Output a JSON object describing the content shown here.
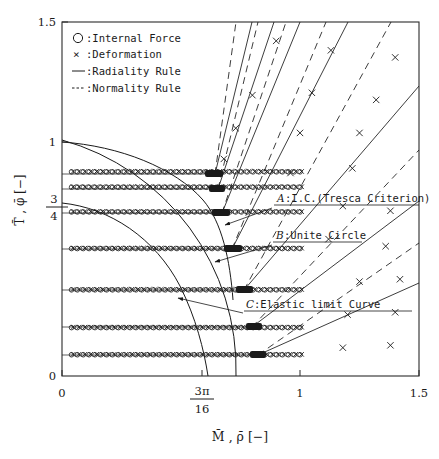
{
  "figure": {
    "title": "",
    "frame": {
      "x0": 62,
      "y0": 22,
      "x1": 419,
      "y1": 376
    }
  },
  "legend": {
    "entries": [
      {
        "marker": "circle-marker",
        "symbol": "O",
        "label": ":Internal Force"
      },
      {
        "marker": "cross-marker",
        "symbol": "×",
        "label": ":Deformation"
      },
      {
        "marker": "solid-line",
        "symbol": "—",
        "label": ":Radiality Rule"
      },
      {
        "marker": "dashed-line",
        "symbol": "---",
        "label": ":Normality Rule"
      }
    ]
  },
  "annotations": [
    {
      "id": "A",
      "key": "A",
      "text": ":I.C.(Tresca Criterion)",
      "x": 277,
      "y": 203
    },
    {
      "id": "B",
      "key": "B",
      "text": ":Unite Circle",
      "x": 276,
      "y": 240
    },
    {
      "id": "C",
      "key": "C",
      "text": ":Elastic limit Curve",
      "x": 246,
      "y": 310
    }
  ],
  "axes": {
    "x": {
      "label_parts": [
        "M",
        ", ",
        "ρ",
        "  [−]"
      ],
      "label": "M̄ , ρ̄  [−]",
      "min": 0,
      "max": 1.5,
      "ticks": [
        {
          "value": 0,
          "text": "0",
          "kind": "plain"
        },
        {
          "value": 0.589,
          "text": "3π/16",
          "kind": "fraction",
          "num": "3π",
          "den": "16"
        },
        {
          "value": 1.0,
          "text": "1",
          "kind": "plain"
        },
        {
          "value": 1.5,
          "text": "1.5",
          "kind": "plain"
        }
      ]
    },
    "y": {
      "label": "T̄ , φ̄  [−]",
      "label_parts": [
        "T",
        ", ",
        "φ",
        "  [−]"
      ],
      "min": 0,
      "max": 1.5,
      "ticks": [
        {
          "value": 0,
          "text": "0",
          "kind": "plain"
        },
        {
          "value": 0.75,
          "text": "3/4",
          "kind": "fraction",
          "num": "3",
          "den": "4"
        },
        {
          "value": 1.0,
          "text": "1",
          "kind": "plain"
        },
        {
          "value": 1.5,
          "text": "1.5",
          "kind": "plain"
        }
      ]
    }
  },
  "chart_data": {
    "type": "scatter",
    "title": "",
    "xlabel": "M̄ , ρ̄  [−]",
    "ylabel": "T̄ , φ̄  [−]",
    "xlim": [
      0,
      1.5
    ],
    "ylim": [
      0,
      1.5
    ],
    "grid": false,
    "legend_position": "top-left",
    "legend": [
      ":Internal Force",
      ":Deformation",
      ":Radiality Rule",
      ":Normality Rule"
    ],
    "series": [
      {
        "name": "Internal Force / Deformation paths (plateau level T̄)",
        "marker": "circle+cross",
        "plateau_levels": [
          0.865,
          0.8,
          0.695,
          0.54,
          0.365,
          0.205,
          0.09
        ],
        "plateau_x_start": 0.04,
        "plateau_x_end": 1.0,
        "description": "Horizontal loading paths at constant T̄ up to the yield surface at M̄ near 1, then turning outward"
      },
      {
        "name": "Radiality Rule",
        "style": "solid",
        "type": "line",
        "fan_origin": [
          1.0,
          0.0
        ],
        "description": "Solid straight rays emanating from the yield-surface contact points to the upper-right"
      },
      {
        "name": "Normality Rule",
        "style": "dashed",
        "type": "line",
        "fan_origin": [
          1.0,
          0.0
        ],
        "description": "Dashed straight rays, steeper than the solid radiality rays"
      },
      {
        "name": "A: I.C. (Tresca Criterion)",
        "style": "solid-curve",
        "description": "Interaction curve, Tresca criterion, from (0,1) bowing to (1,0)"
      },
      {
        "name": "B: Unite Circle",
        "style": "solid-curve",
        "description": "Unit circle quarter arc from (0,1) to (1,0)"
      },
      {
        "name": "C: Elastic limit Curve",
        "style": "solid-curve",
        "description": "Elastic limit curve lying inside the unit circle"
      }
    ],
    "scattered_crosses_upper_right": [
      [
        0.9,
        1.42
      ],
      [
        1.13,
        1.38
      ],
      [
        1.4,
        1.35
      ],
      [
        0.8,
        1.19
      ],
      [
        1.05,
        1.2
      ],
      [
        1.32,
        1.17
      ],
      [
        0.73,
        1.05
      ],
      [
        1.0,
        1.03
      ],
      [
        1.25,
        1.03
      ],
      [
        0.68,
        0.92
      ],
      [
        0.96,
        0.86
      ],
      [
        1.22,
        0.88
      ],
      [
        1.18,
        0.72
      ],
      [
        1.38,
        0.7
      ],
      [
        1.12,
        0.58
      ],
      [
        1.36,
        0.55
      ],
      [
        1.25,
        0.4
      ],
      [
        1.42,
        0.41
      ],
      [
        1.2,
        0.26
      ],
      [
        1.4,
        0.27
      ],
      [
        1.18,
        0.12
      ],
      [
        1.38,
        0.13
      ]
    ]
  },
  "colors": {
    "ink": "#1a1a1a",
    "frame": "#2b2b2b",
    "background": "#ffffff"
  }
}
